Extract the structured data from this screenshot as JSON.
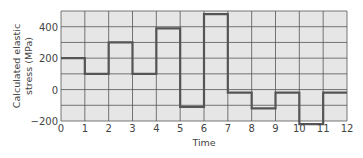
{
  "chart_data": {
    "type": "line",
    "subtype": "step",
    "title": "",
    "xlabel": "Time",
    "ylabel": "Calculated elastic stress (MPa)",
    "ylabel_lines": [
      "Calculated elastic",
      "stress (MPa)"
    ],
    "xlim": [
      0,
      12
    ],
    "ylim": [
      -200,
      500
    ],
    "x_ticks": [
      0,
      1,
      2,
      3,
      4,
      5,
      6,
      7,
      8,
      9,
      10,
      11,
      12
    ],
    "y_ticks": [
      -200,
      0,
      200,
      400
    ],
    "y_tick_labels": [
      "−200",
      "0",
      "200",
      "400"
    ],
    "grid": true,
    "grid_y_step": 100,
    "grid_x_step": 1,
    "legend": null,
    "series": [
      {
        "name": "Calculated elastic stress",
        "segments": [
          {
            "x0": 0,
            "x1": 1,
            "y": 200
          },
          {
            "x0": 1,
            "x1": 2,
            "y": 100
          },
          {
            "x0": 2,
            "x1": 3,
            "y": 300
          },
          {
            "x0": 3,
            "x1": 4,
            "y": 100
          },
          {
            "x0": 4,
            "x1": 5,
            "y": 390
          },
          {
            "x0": 5,
            "x1": 6,
            "y": -110
          },
          {
            "x0": 6,
            "x1": 7,
            "y": 480
          },
          {
            "x0": 7,
            "x1": 8,
            "y": -20
          },
          {
            "x0": 8,
            "x1": 9,
            "y": -120
          },
          {
            "x0": 9,
            "x1": 10,
            "y": -20
          },
          {
            "x0": 10,
            "x1": 11,
            "y": -220
          },
          {
            "x0": 11,
            "x1": 12,
            "y": -20
          }
        ]
      }
    ],
    "colors": {
      "plot_bg": "#e6e6e6",
      "grid": "#555555",
      "line": "#555555",
      "text": "#444444"
    }
  }
}
